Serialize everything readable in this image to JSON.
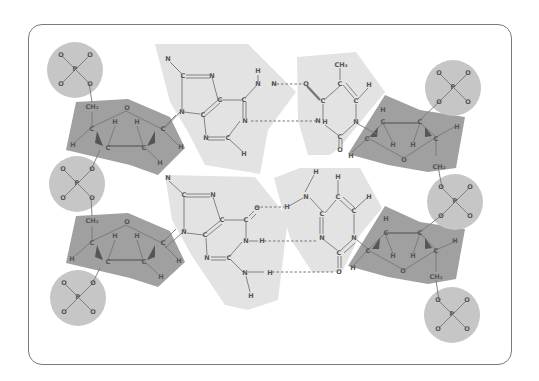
{
  "diagram": {
    "colors": {
      "frame_border": "#7a7a7a",
      "phosphate_fill": "#c6c6c6",
      "sugar_fill": "#a0a0a0",
      "base_fill": "#e3e3e3",
      "atom_label": "#555555",
      "bond": "#777777"
    },
    "phosphate_groups": [
      {
        "id": "p1",
        "center": "P",
        "oxygens": [
          "O",
          "O",
          "O",
          "O"
        ]
      },
      {
        "id": "p2",
        "center": "P",
        "oxygens": [
          "O",
          "O",
          "O",
          "O"
        ]
      },
      {
        "id": "p3",
        "center": "P",
        "oxygens": [
          "O",
          "O",
          "O",
          "O"
        ]
      },
      {
        "id": "p4",
        "center": "P",
        "oxygens": [
          "O",
          "O",
          "O",
          "O"
        ]
      },
      {
        "id": "p5",
        "center": "P",
        "oxygens": [
          "O",
          "O",
          "O",
          "O"
        ]
      },
      {
        "id": "p6",
        "center": "P",
        "oxygens": [
          "O",
          "O",
          "O",
          "O"
        ]
      }
    ],
    "sugars": [
      {
        "id": "s1",
        "ring_oxygen": "O",
        "ch2": "CH₂",
        "atoms": [
          "C",
          "C",
          "C",
          "C",
          "H",
          "H",
          "H",
          "H"
        ]
      },
      {
        "id": "s2",
        "ring_oxygen": "O",
        "ch2": "CH₂",
        "atoms": [
          "C",
          "C",
          "C",
          "C",
          "H",
          "H",
          "H",
          "H"
        ]
      },
      {
        "id": "s3",
        "ring_oxygen": "O",
        "ch2": "CH₂",
        "atoms": [
          "C",
          "C",
          "C",
          "C",
          "H",
          "H",
          "H",
          "H"
        ]
      },
      {
        "id": "s4",
        "ring_oxygen": "O",
        "ch2": "CH₂",
        "atoms": [
          "C",
          "C",
          "C",
          "C",
          "H",
          "H",
          "H",
          "H"
        ]
      }
    ],
    "base_pairs": [
      {
        "left": "Adenine",
        "right": "Thymine",
        "hydrogen_bonds": 2,
        "methyl_label": "CH₃"
      },
      {
        "left": "Guanine",
        "right": "Cytosine",
        "hydrogen_bonds": 3
      }
    ],
    "labels": {
      "C": "C",
      "N": "N",
      "H": "H",
      "O": "O",
      "P": "P",
      "CH2": "CH₂",
      "CH3": "CH₃"
    }
  }
}
